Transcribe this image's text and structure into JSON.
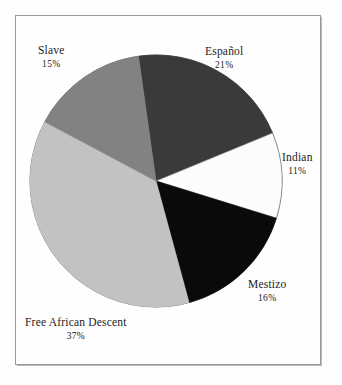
{
  "figure": {
    "background_color": "#fefefe",
    "frame_color": "#9a9a9a",
    "text_color": "#1a1a1a"
  },
  "chart_data": {
    "type": "pie",
    "title": "",
    "subtitle": "",
    "xlabel": "",
    "ylabel": "",
    "grid": false,
    "legend_position": "none",
    "labels_position": "outside",
    "units": "percent",
    "center": {
      "x": 156,
      "y": 181
    },
    "radius": 126,
    "start_angle_deg": -8,
    "direction": "clockwise",
    "categories": [
      "Español",
      "Indian",
      "Mestizo",
      "Free African Descent",
      "Slave"
    ],
    "values": [
      21,
      11,
      16,
      37,
      15
    ],
    "slices": [
      {
        "name": "Español",
        "percent": 21,
        "percent_label": "21%",
        "color": "#3a3a3a",
        "start_angle_deg": -8,
        "end_angle_deg": 67.6,
        "label_x": 205,
        "label_y": 45
      },
      {
        "name": "Indian",
        "percent": 11,
        "percent_label": "11%",
        "color": "#fcfcfc",
        "start_angle_deg": 67.6,
        "end_angle_deg": 107.2,
        "label_x": 282,
        "label_y": 151
      },
      {
        "name": "Mestizo",
        "percent": 16,
        "percent_label": "16%",
        "color": "#0a0a0a",
        "start_angle_deg": 107.2,
        "end_angle_deg": 164.8,
        "label_x": 248,
        "label_y": 278
      },
      {
        "name": "Free African Descent",
        "percent": 37,
        "percent_label": "37%",
        "color": "#c2c2c2",
        "start_angle_deg": 164.8,
        "end_angle_deg": 298.0,
        "label_x": 25,
        "label_y": 316
      },
      {
        "name": "Slave",
        "percent": 15,
        "percent_label": "15%",
        "color": "#828282",
        "start_angle_deg": 298.0,
        "end_angle_deg": 352.0,
        "label_x": 38,
        "label_y": 44
      }
    ]
  }
}
